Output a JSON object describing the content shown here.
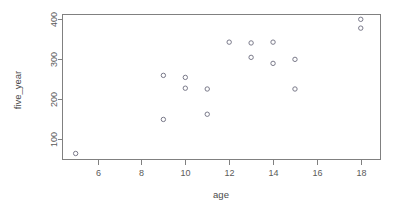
{
  "chart_data": {
    "type": "scatter",
    "title": "",
    "xlabel": "age",
    "ylabel": "five_year",
    "xlim": [
      4.4,
      18.9
    ],
    "ylim": [
      50,
      412
    ],
    "grid": false,
    "legend": null,
    "xticks": [
      6,
      8,
      10,
      12,
      14,
      16,
      18
    ],
    "xticklabels": [
      "6",
      "8",
      "10",
      "12",
      "14",
      "16",
      "18"
    ],
    "yticks": [
      100,
      200,
      300,
      400
    ],
    "yticklabels": [
      "100",
      "200",
      "300",
      "400"
    ],
    "marker": "open-circle",
    "marker_color": "#7a7a8a",
    "points": [
      {
        "x": 5,
        "y": 65
      },
      {
        "x": 9,
        "y": 260
      },
      {
        "x": 9,
        "y": 150
      },
      {
        "x": 10,
        "y": 255
      },
      {
        "x": 10,
        "y": 228
      },
      {
        "x": 11,
        "y": 226
      },
      {
        "x": 11,
        "y": 163
      },
      {
        "x": 12,
        "y": 343
      },
      {
        "x": 13,
        "y": 341
      },
      {
        "x": 13,
        "y": 305
      },
      {
        "x": 14,
        "y": 343
      },
      {
        "x": 14,
        "y": 290
      },
      {
        "x": 15,
        "y": 300
      },
      {
        "x": 15,
        "y": 226
      },
      {
        "x": 18,
        "y": 400
      },
      {
        "x": 18,
        "y": 378
      }
    ],
    "x": [
      5,
      9,
      9,
      10,
      10,
      11,
      11,
      12,
      13,
      13,
      14,
      14,
      15,
      15,
      18,
      18
    ],
    "y": [
      65,
      260,
      150,
      255,
      228,
      226,
      163,
      343,
      341,
      305,
      343,
      290,
      300,
      226,
      400,
      378
    ]
  },
  "axes": {
    "x_title": "age",
    "y_title": "five_year"
  },
  "colors": {
    "background": "#ffffff",
    "axis": "#808080",
    "tick_text": "#5a5a5a",
    "marker": "#7a7a8a"
  }
}
